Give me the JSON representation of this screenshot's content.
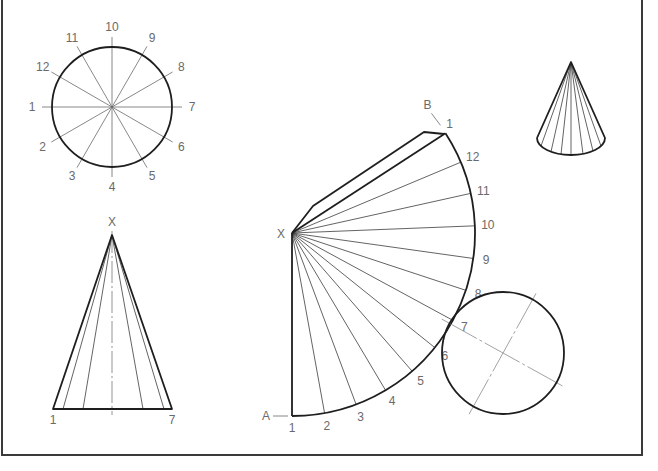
{
  "figure": {
    "colors": {
      "line": "#1e1e1e",
      "construction": "#6a6a6a",
      "label": "#6a6a6a",
      "frame": "#3a3a3a"
    }
  },
  "plan_view": {
    "center": [
      112,
      107
    ],
    "radius": 60,
    "line_extent": 70,
    "label_radius": 80,
    "labels": [
      {
        "text": "1",
        "angle_deg": 180
      },
      {
        "text": "2",
        "angle_deg": 210
      },
      {
        "text": "3",
        "angle_deg": 240
      },
      {
        "text": "4",
        "angle_deg": 270
      },
      {
        "text": "5",
        "angle_deg": 300
      },
      {
        "text": "6",
        "angle_deg": 330
      },
      {
        "text": "7",
        "angle_deg": 0
      },
      {
        "text": "8",
        "angle_deg": 30
      },
      {
        "text": "9",
        "angle_deg": 60
      },
      {
        "text": "10",
        "angle_deg": 90
      },
      {
        "text": "11",
        "angle_deg": 120
      },
      {
        "text": "12",
        "angle_deg": 150
      }
    ]
  },
  "front_view": {
    "apex": [
      112,
      235
    ],
    "base_left": [
      53,
      409
    ],
    "base_right": [
      172,
      409
    ],
    "element_base_x": [
      63,
      83,
      143,
      164
    ],
    "apex_label": "X",
    "base_labels": [
      {
        "text": "1",
        "pos": [
          53,
          424
        ]
      },
      {
        "text": "7",
        "pos": [
          172,
          424
        ]
      }
    ]
  },
  "development": {
    "apex": [
      292,
      233
    ],
    "radius": 183,
    "start_angle_deg": 90,
    "step_deg": -10.25,
    "apex_label": "X",
    "start_label": "A",
    "end_label": "B",
    "tab": [
      [
        292,
        233
      ],
      [
        313,
        206
      ],
      [
        424,
        132
      ],
      [
        444,
        134
      ]
    ],
    "point_labels": [
      "1",
      "2",
      "3",
      "4",
      "5",
      "6",
      "7",
      "8",
      "9",
      "10",
      "11",
      "12",
      "1"
    ]
  },
  "base_circle": {
    "center": [
      503,
      353
    ],
    "radius": 61,
    "axis_angles_deg": [
      29,
      -61
    ],
    "axis_half_length": 70
  },
  "pictorial_cone": {
    "apex": [
      571,
      62
    ],
    "base_center": [
      571,
      138
    ],
    "rx": 34,
    "ry": 17,
    "element_offsets": [
      -30,
      -20,
      -10,
      0,
      12,
      22,
      30
    ]
  },
  "frame": {
    "left": 2,
    "right": 642,
    "bottom": 455
  }
}
